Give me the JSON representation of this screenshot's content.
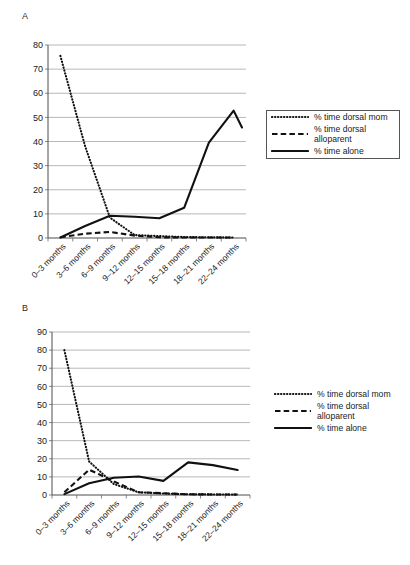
{
  "figure": {
    "panels": [
      {
        "letter": "A",
        "legend_boxed": true,
        "chart": {
          "type": "line",
          "title": "",
          "xlabel": "",
          "ylabel": "",
          "ylim": [
            0,
            80
          ],
          "yticks": [
            0,
            10,
            20,
            30,
            40,
            50,
            60,
            70,
            80
          ],
          "grid": true,
          "legend_position": "right",
          "categories": [
            "0–3 months",
            "3–6 months",
            "6–9 months",
            "9–12 months",
            "12–15 months",
            "15–18 months",
            "18–21 months",
            "22–24 months"
          ],
          "series": [
            {
              "name": "% time dorsal mom",
              "style": "dotted",
              "values": [
                75.5,
                38.0,
                8.5,
                1.2,
                0.8,
                0.4,
                0.3,
                0.2
              ]
            },
            {
              "name": "% time dorsal alloparent",
              "style": "dashed",
              "values": [
                0.3,
                1.8,
                2.5,
                1.0,
                0.3,
                0.2,
                0.2,
                0.2
              ]
            },
            {
              "name": "% time alone",
              "style": "solid",
              "values": [
                0.2,
                5.0,
                9.2,
                8.8,
                8.2,
                12.5,
                39.5,
                52.8
              ]
            }
          ],
          "series_alone_extra_point": 45.8
        }
      },
      {
        "letter": "B",
        "legend_boxed": false,
        "chart": {
          "type": "line",
          "title": "",
          "xlabel": "",
          "ylabel": "",
          "ylim": [
            0,
            90
          ],
          "yticks": [
            0,
            10,
            20,
            30,
            40,
            50,
            60,
            70,
            80,
            90
          ],
          "grid": true,
          "legend_position": "right",
          "categories": [
            "0–3 months",
            "3–6 months",
            "6–9 months",
            "9–12 months",
            "12–15 months",
            "15–18 months",
            "18–21 months",
            "22–24 months"
          ],
          "series": [
            {
              "name": "% time dorsal mom",
              "style": "dotted",
              "values": [
                80.0,
                18.5,
                6.0,
                1.5,
                0.8,
                0.4,
                0.3,
                0.2
              ]
            },
            {
              "name": "% time dorsal alloparent",
              "style": "dashed",
              "values": [
                1.5,
                14.0,
                7.5,
                1.5,
                1.0,
                0.4,
                0.3,
                0.3
              ]
            },
            {
              "name": "% time alone",
              "style": "solid",
              "values": [
                0.5,
                6.5,
                9.5,
                10.2,
                7.8,
                18.0,
                16.5,
                13.8
              ]
            }
          ]
        }
      }
    ],
    "legend_entries": [
      {
        "label": "% time dorsal mom",
        "style": "dotted"
      },
      {
        "label": "% time dorsal\nalloparent",
        "style": "dashed"
      },
      {
        "label": "% time alone",
        "style": "solid"
      }
    ],
    "colors": {
      "line": "#111111",
      "grid": "#9a9a9a",
      "axis": "#4d4d4d",
      "text": "#1a1a1a",
      "background": "#ffffff"
    }
  }
}
